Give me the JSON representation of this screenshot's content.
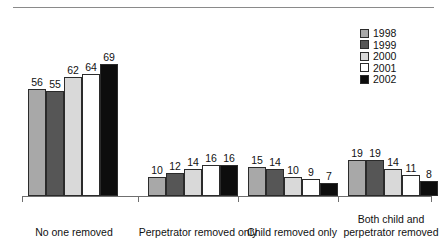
{
  "chart_data": {
    "type": "bar",
    "title": "",
    "subtitle": "",
    "xlabel": "",
    "ylabel": "",
    "ylim": [
      0,
      69
    ],
    "grid": false,
    "legend_position": "top-right",
    "categories": [
      "No one removed",
      "Perpetrator removed only",
      "Child removed only",
      "Both child and perpetrator removed"
    ],
    "series": [
      {
        "name": "1998",
        "color": "#a8a8a8",
        "values": [
          56,
          10,
          15,
          19
        ]
      },
      {
        "name": "1999",
        "color": "#565656",
        "values": [
          55,
          12,
          14,
          19
        ]
      },
      {
        "name": "2000",
        "color": "#d9d9d9",
        "values": [
          62,
          14,
          10,
          14
        ]
      },
      {
        "name": "2001",
        "color": "#ffffff",
        "values": [
          64,
          16,
          9,
          11
        ]
      },
      {
        "name": "2002",
        "color": "#0d0d0d",
        "values": [
          69,
          16,
          7,
          8
        ]
      }
    ]
  },
  "legend": {
    "items": [
      {
        "label": "1998",
        "color": "#a8a8a8"
      },
      {
        "label": "1999",
        "color": "#565656"
      },
      {
        "label": "2000",
        "color": "#d9d9d9"
      },
      {
        "label": "2001",
        "color": "#ffffff"
      },
      {
        "label": "2002",
        "color": "#0d0d0d"
      }
    ]
  },
  "axis": {
    "baseline_color": "#6f6f6f",
    "rule_color": "#8a8a8a"
  }
}
